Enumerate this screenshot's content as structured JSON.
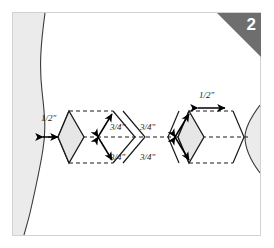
{
  "figure": {
    "step_number": "2",
    "badge_color": "#6e6e6e",
    "frame_border_color": "#d2d2d2",
    "background_color": "#ffffff",
    "fabric_fill_color": "#ebebeb",
    "fabric_edge_color": "#3a3a3a",
    "piece_fill_color": "#e6e6e6",
    "piece_outline_color": "#1a1a1a",
    "dashed_line_color": "#1a1a1a",
    "arrow_color": "#000000"
  },
  "dimensions": {
    "left_seam_allowance": "1/2\"",
    "left_upper_edge": "3/4\"",
    "left_lower_edge": "3/4\"",
    "right_upper_edge": "3/4\"",
    "right_lower_edge": "3/4\"",
    "right_top_width": "1/2\""
  },
  "labels": [
    {
      "id": "left-half-inch",
      "text": "1/2\"",
      "x": 28,
      "y": 103
    },
    {
      "id": "left-upper-three-quarter",
      "text": "3/4\"",
      "x": 99,
      "y": 115
    },
    {
      "id": "left-lower-three-quarter",
      "text": "3/4\"",
      "x": 99,
      "y": 143
    },
    {
      "id": "right-upper-three-quarter",
      "text": "3/4\"",
      "x": 157,
      "y": 115
    },
    {
      "id": "right-lower-three-quarter",
      "text": "3/4\"",
      "x": 157,
      "y": 143
    },
    {
      "id": "right-half-inch",
      "text": "1/2\"",
      "x": 199,
      "y": 88
    }
  ]
}
